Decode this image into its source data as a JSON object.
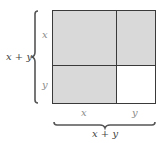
{
  "diagram": {
    "regions": [
      {
        "id": "x_by_x",
        "fill": "#d9d9d9"
      },
      {
        "id": "x_by_y_top",
        "fill": "#d9d9d9"
      },
      {
        "id": "y_by_x",
        "fill": "#d9d9d9"
      },
      {
        "id": "y_by_y",
        "fill": "#ffffff"
      }
    ],
    "labels": {
      "left_total": "x + y",
      "left_top": "x",
      "left_bottom": "y",
      "bottom_left": "x",
      "bottom_right": "y",
      "bottom_total": "x + y"
    },
    "colors": {
      "shaded": "#d9d9d9",
      "unshaded": "#ffffff",
      "line": "#3a3a3a"
    }
  }
}
